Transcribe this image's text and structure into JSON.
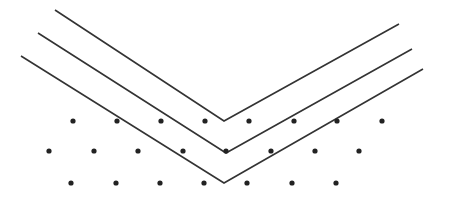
{
  "diagram": {
    "colors": {
      "background": "#ffffff",
      "line": "#333333",
      "dot": "#222222"
    },
    "line_width": 1.6,
    "dot_radius": 2.6,
    "chevrons": [
      {
        "left": [
          55,
          10
        ],
        "vertex": [
          224,
          121
        ],
        "right": [
          399,
          24
        ]
      },
      {
        "left": [
          38,
          33
        ],
        "vertex": [
          226,
          153
        ],
        "right": [
          412,
          49
        ]
      },
      {
        "left": [
          21,
          56
        ],
        "vertex": [
          224,
          183
        ],
        "right": [
          423,
          69
        ]
      }
    ],
    "dot_rows": [
      {
        "y": 121,
        "x": [
          73,
          117,
          161,
          205,
          249,
          294,
          337,
          382
        ]
      },
      {
        "y": 151,
        "x": [
          49,
          94,
          138,
          183,
          226,
          271,
          315,
          359
        ]
      },
      {
        "y": 183,
        "x": [
          71,
          116,
          160,
          204,
          247,
          292,
          336
        ]
      }
    ]
  }
}
